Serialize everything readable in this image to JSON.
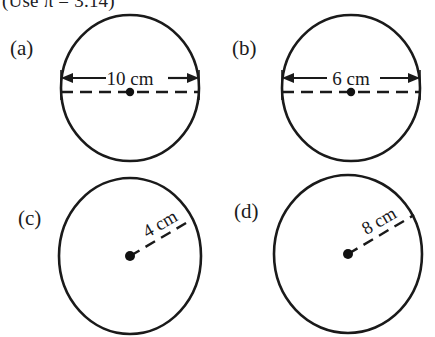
{
  "figure": {
    "instruction": "(Use π = 3.14)",
    "background_color": "#ffffff",
    "ink_color": "#1a1a1a",
    "parts": [
      {
        "key": "a",
        "label": "(a)",
        "shape": "circle",
        "measure_type": "diameter",
        "measure_label": "10 cm",
        "measure_value": 10,
        "measure_unit": "cm",
        "line_style": "dashed",
        "has_center_dot": true,
        "has_arrowheads": true
      },
      {
        "key": "b",
        "label": "(b)",
        "shape": "circle",
        "measure_type": "diameter",
        "measure_label": "6 cm",
        "measure_value": 6,
        "measure_unit": "cm",
        "line_style": "dashed",
        "has_center_dot": true,
        "has_arrowheads": true
      },
      {
        "key": "c",
        "label": "(c)",
        "shape": "circle",
        "measure_type": "radius",
        "measure_label": "4 cm",
        "measure_value": 4,
        "measure_unit": "cm",
        "line_style": "dashed",
        "has_center_dot": true,
        "has_arrowheads": false
      },
      {
        "key": "d",
        "label": "(d)",
        "shape": "circle",
        "measure_type": "radius",
        "measure_label": "8 cm",
        "measure_value": 8,
        "measure_unit": "cm",
        "line_style": "dashed",
        "has_center_dot": true,
        "has_arrowheads": false
      }
    ]
  }
}
